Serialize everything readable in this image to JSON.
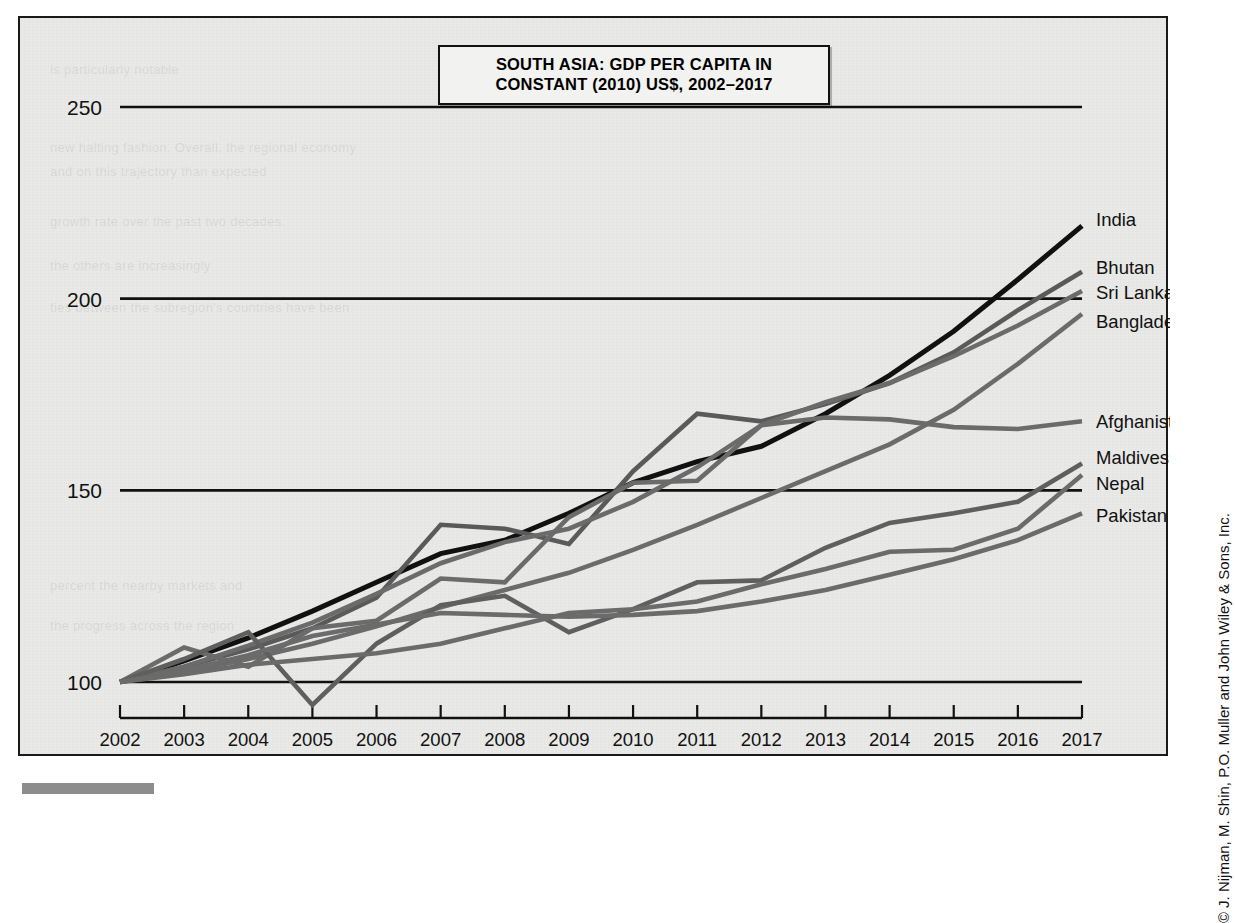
{
  "figure": {
    "credit": "© J. Nijman, M. Shin, P.O. Muller and John Wiley & Sons, Inc."
  },
  "title": {
    "line1": "SOUTH ASIA: GDP PER CAPITA IN",
    "line2": "CONSTANT (2010) US$, 2002–2017"
  },
  "ghost_text": {
    "g1": "is particularly notable",
    "g2": "new halting fashion. Overall, the regional economy",
    "g3": "and on this trajectory than expected",
    "g4": "growth rate over the past two decades.",
    "g5": "the others are increasingly",
    "g6": "ties between the subregion's countries have been",
    "g7": "percent the nearby markets and",
    "g8": "the progress across the region"
  },
  "chart_data": {
    "type": "line",
    "title": "SOUTH ASIA: GDP PER CAPITA IN CONSTANT (2010) US$, 2002–2017",
    "xlabel": "",
    "ylabel": "",
    "note": "Index values: 2002 = 100",
    "grid": true,
    "legend_position": "right-of-plot (inline end labels)",
    "x": [
      2002,
      2003,
      2004,
      2005,
      2006,
      2007,
      2008,
      2009,
      2010,
      2011,
      2012,
      2013,
      2014,
      2015,
      2016,
      2017
    ],
    "xlim": [
      2002,
      2017
    ],
    "ylim": [
      95,
      255
    ],
    "yticks": [
      100,
      150,
      200,
      250
    ],
    "xticks": [
      "2002",
      "2003",
      "2004",
      "2005",
      "2006",
      "2007",
      "2008",
      "2009",
      "2010",
      "2011",
      "2012",
      "2013",
      "2014",
      "2015",
      "2016",
      "2017"
    ],
    "series": [
      {
        "name": "India",
        "color": "#111111",
        "width": 5.0,
        "values": [
          100,
          105.5,
          111.5,
          118.5,
          126,
          133.5,
          137,
          144,
          152,
          157.5,
          161.5,
          170,
          180,
          191.5,
          205,
          219
        ]
      },
      {
        "name": "Bhutan",
        "color": "#5a5a5a",
        "width": 4.6,
        "values": [
          100,
          104,
          108.5,
          114,
          122,
          141,
          140,
          136,
          155,
          170,
          168,
          172.5,
          178,
          186,
          197,
          207
        ]
      },
      {
        "name": "Sri Lanka",
        "color": "#6b6b6b",
        "width": 4.6,
        "values": [
          100,
          104,
          109.5,
          115.5,
          123,
          131,
          136.5,
          140,
          147,
          156,
          167,
          173,
          178,
          185,
          193,
          202
        ]
      },
      {
        "name": "Bangladesh",
        "color": "#6b6b6b",
        "width": 4.6,
        "values": [
          100,
          102.5,
          106,
          110,
          114.5,
          119.5,
          124,
          128.5,
          134.5,
          141,
          148,
          155,
          162,
          171,
          183,
          196
        ]
      },
      {
        "name": "Afghanistan",
        "color": "#6b6b6b",
        "width": 4.6,
        "values": [
          100,
          109,
          104,
          114,
          116,
          127,
          126,
          143,
          152,
          152.5,
          167,
          169,
          168.5,
          166.5,
          166,
          168
        ]
      },
      {
        "name": "Maldives",
        "color": "#5f5f5f",
        "width": 4.6,
        "values": [
          100,
          106,
          113,
          94,
          110,
          120,
          122.5,
          113,
          119,
          126,
          126.5,
          135,
          141.5,
          144,
          147,
          157
        ]
      },
      {
        "name": "Nepal",
        "color": "#6b6b6b",
        "width": 4.6,
        "values": [
          100,
          102,
          104.5,
          106,
          107.5,
          110,
          114,
          118,
          119,
          121,
          125.5,
          129.5,
          134,
          134.5,
          140,
          154
        ]
      },
      {
        "name": "Pakistan",
        "color": "#6b6b6b",
        "width": 4.6,
        "values": [
          100,
          103,
          107,
          112,
          115,
          118,
          117.5,
          117,
          117.5,
          118.5,
          121,
          124,
          128,
          132,
          137,
          144
        ]
      }
    ]
  }
}
